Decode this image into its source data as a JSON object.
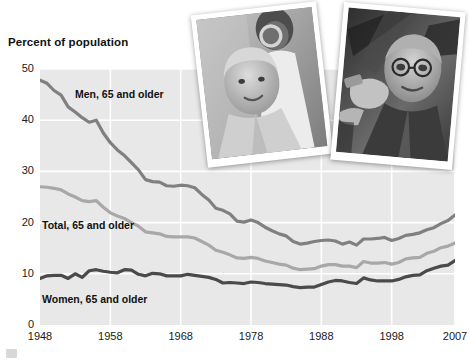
{
  "chart_data": {
    "type": "line",
    "title": "Percent of population",
    "xlabel": "",
    "ylabel": "Percent of population",
    "xlim": [
      1948,
      2007
    ],
    "ylim": [
      0,
      50
    ],
    "grid": true,
    "legend_position": "inline-labels",
    "ytick_labels": [
      "0",
      "10",
      "20",
      "30",
      "40",
      "50"
    ],
    "ytick_values": [
      0,
      10,
      20,
      30,
      40,
      50
    ],
    "xtick_labels": [
      "1948",
      "1958",
      "1968",
      "1978",
      "1988",
      "1998",
      "2007"
    ],
    "xtick_values": [
      1948,
      1958,
      1968,
      1978,
      1988,
      1998,
      2007
    ],
    "series": [
      {
        "name": "Men, 65 and older",
        "color": "#808080",
        "x": [
          1948,
          1949,
          1950,
          1951,
          1952,
          1953,
          1954,
          1955,
          1956,
          1957,
          1958,
          1959,
          1960,
          1961,
          1962,
          1963,
          1964,
          1965,
          1966,
          1967,
          1968,
          1969,
          1970,
          1971,
          1972,
          1973,
          1974,
          1975,
          1976,
          1977,
          1978,
          1979,
          1980,
          1981,
          1982,
          1983,
          1984,
          1985,
          1986,
          1987,
          1988,
          1989,
          1990,
          1991,
          1992,
          1993,
          1994,
          1995,
          1996,
          1997,
          1998,
          1999,
          2000,
          2001,
          2002,
          2003,
          2004,
          2005,
          2006,
          2007
        ],
        "values": [
          47.8,
          47.2,
          45.8,
          44.9,
          42.6,
          41.6,
          40.5,
          39.6,
          40.0,
          37.5,
          35.6,
          34.2,
          33.1,
          31.7,
          30.3,
          28.4,
          28.0,
          27.9,
          27.2,
          27.1,
          27.3,
          27.2,
          26.8,
          25.5,
          24.4,
          22.8,
          22.4,
          21.7,
          20.3,
          20.1,
          20.5,
          20.0,
          19.1,
          18.4,
          17.8,
          17.4,
          16.3,
          15.8,
          16.0,
          16.3,
          16.5,
          16.6,
          16.4,
          15.8,
          16.2,
          15.6,
          16.8,
          16.8,
          16.9,
          17.1,
          16.5,
          16.9,
          17.5,
          17.7,
          18.0,
          18.6,
          19.0,
          19.8,
          20.4,
          21.5
        ]
      },
      {
        "name": "Total, 65 and older",
        "color": "#a8a8a8",
        "x": [
          1948,
          1949,
          1950,
          1951,
          1952,
          1953,
          1954,
          1955,
          1956,
          1957,
          1958,
          1959,
          1960,
          1961,
          1962,
          1963,
          1964,
          1965,
          1966,
          1967,
          1968,
          1969,
          1970,
          1971,
          1972,
          1973,
          1974,
          1975,
          1976,
          1977,
          1978,
          1979,
          1980,
          1981,
          1982,
          1983,
          1984,
          1985,
          1986,
          1987,
          1988,
          1989,
          1990,
          1991,
          1992,
          1993,
          1994,
          1995,
          1996,
          1997,
          1998,
          1999,
          2000,
          2001,
          2002,
          2003,
          2004,
          2005,
          2006,
          2007
        ],
        "values": [
          27.0,
          26.9,
          26.7,
          26.4,
          25.6,
          25.0,
          24.3,
          24.1,
          24.3,
          23.0,
          21.9,
          21.3,
          20.8,
          20.0,
          19.3,
          18.2,
          18.0,
          17.8,
          17.3,
          17.2,
          17.2,
          17.2,
          17.0,
          16.3,
          15.6,
          14.6,
          14.2,
          13.7,
          13.1,
          13.0,
          13.2,
          13.0,
          12.5,
          12.2,
          11.9,
          11.7,
          11.1,
          10.8,
          10.9,
          11.0,
          11.5,
          11.8,
          11.8,
          11.5,
          11.5,
          11.2,
          12.4,
          12.1,
          12.1,
          12.2,
          11.9,
          12.2,
          12.9,
          13.1,
          13.2,
          14.0,
          14.4,
          15.1,
          15.4,
          16.0
        ]
      },
      {
        "name": "Women, 65 and older",
        "color": "#4a4a4a",
        "x": [
          1948,
          1949,
          1950,
          1951,
          1952,
          1953,
          1954,
          1955,
          1956,
          1957,
          1958,
          1959,
          1960,
          1961,
          1962,
          1963,
          1964,
          1965,
          1966,
          1967,
          1968,
          1969,
          1970,
          1971,
          1972,
          1973,
          1974,
          1975,
          1976,
          1977,
          1978,
          1979,
          1980,
          1981,
          1982,
          1983,
          1984,
          1985,
          1986,
          1987,
          1988,
          1989,
          1990,
          1991,
          1992,
          1993,
          1994,
          1995,
          1996,
          1997,
          1998,
          1999,
          2000,
          2001,
          2002,
          2003,
          2004,
          2005,
          2006,
          2007
        ],
        "values": [
          9.1,
          9.6,
          9.7,
          9.7,
          9.1,
          10.0,
          9.3,
          10.6,
          10.8,
          10.5,
          10.3,
          10.2,
          10.8,
          10.7,
          9.9,
          9.6,
          10.1,
          10.0,
          9.6,
          9.6,
          9.6,
          9.9,
          9.7,
          9.5,
          9.3,
          8.9,
          8.2,
          8.3,
          8.2,
          8.1,
          8.4,
          8.3,
          8.1,
          8.0,
          7.9,
          7.8,
          7.5,
          7.3,
          7.4,
          7.4,
          7.9,
          8.4,
          8.7,
          8.6,
          8.3,
          8.1,
          9.2,
          8.8,
          8.6,
          8.6,
          8.6,
          8.9,
          9.4,
          9.7,
          9.8,
          10.6,
          11.1,
          11.5,
          11.7,
          12.6
        ]
      }
    ]
  },
  "labels": {
    "axis_title": "Percent of population",
    "men": "Men, 65 and older",
    "total": "Total, 65 and older",
    "women": "Women, 65 and older"
  },
  "photos": [
    {
      "id": "photo-left",
      "alt": "older woman smiling in clinical setting with man behind"
    },
    {
      "id": "photo-right",
      "alt": "older man with glasses holding a tool"
    }
  ],
  "colors": {
    "plot_background": "#e8e8e8",
    "gridline": "#ffffff",
    "men_line": "#808080",
    "total_line": "#a8a8a8",
    "women_line": "#4a4a4a",
    "text": "#1a1a1a"
  }
}
